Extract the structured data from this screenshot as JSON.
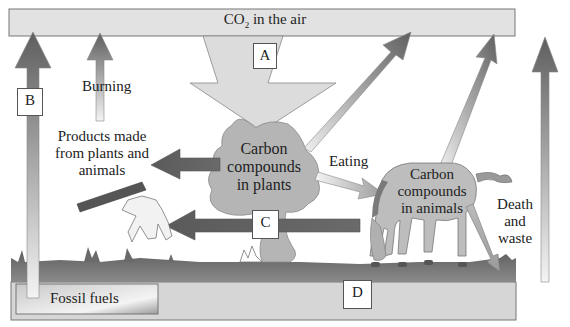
{
  "diagram": {
    "air_bar": {
      "label_prefix": "CO",
      "label_sub": "2",
      "label_suffix": " in the air"
    },
    "fossil_fuels": {
      "label": "Fossil fuels"
    },
    "plants": {
      "label_line1": "Carbon",
      "label_line2": "compounds",
      "label_line3": "in plants"
    },
    "animals": {
      "label_line1": "Carbon",
      "label_line2": "compounds",
      "label_line3": "in animals"
    },
    "products": {
      "label_line1": "Products made",
      "label_line2": "from plants and",
      "label_line3": "animals"
    },
    "process_labels": {
      "burning": "Burning",
      "eating": "Eating",
      "death_line1": "Death",
      "death_line2": "and",
      "death_line3": "waste"
    },
    "letter_boxes": {
      "a": "A",
      "b": "B",
      "c": "C",
      "d": "D"
    },
    "colors": {
      "air_bar": "#e2e2e2",
      "ground": "#d4d4d4",
      "grass": "#6e6e6e",
      "arrow_dark": "#6a6a6a",
      "arrow_light": "#f2f2f2",
      "tree": "#b5b5b5",
      "horse": "#bdbdbd",
      "big_arrow": "#dcdcdc"
    }
  }
}
